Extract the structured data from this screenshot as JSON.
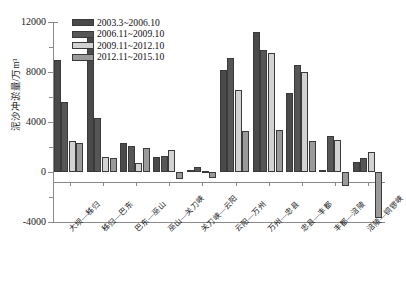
{
  "chart_data": {
    "type": "bar",
    "title": "",
    "xlabel": "",
    "ylabel": "泥沙冲淤量/万m³",
    "ylim": [
      -4000,
      12000
    ],
    "yticks": [
      -4000,
      0,
      4000,
      8000,
      12000
    ],
    "ytick_labels": [
      "-4000",
      "0",
      "4000",
      "8000",
      "12000"
    ],
    "grid": false,
    "legend_position": "top-left",
    "categories": [
      "大坝—秭归",
      "秭归—巴东",
      "巴东—巫山",
      "巫山—关刀峡",
      "关刀峡—云阳",
      "云阳—万州",
      "万州—忠县",
      "忠县—丰都",
      "丰都—涪陵",
      "涪陵—铜锣峡"
    ],
    "series": [
      {
        "name": "2003.3~2006.10",
        "color": "#4a4a4a",
        "values": [
          9000,
          11200,
          2300,
          1200,
          150,
          8200,
          11200,
          6300,
          200,
          800
        ]
      },
      {
        "name": "2006.11~2009.10",
        "color": "#565656",
        "values": [
          5600,
          4300,
          2100,
          1300,
          400,
          9100,
          9800,
          8550,
          2900,
          1100
        ]
      },
      {
        "name": "2009.11~2012.10",
        "color": "#d2d2d2",
        "values": [
          2500,
          1200,
          700,
          1800,
          100,
          6600,
          9500,
          8000,
          2600,
          1600
        ]
      },
      {
        "name": "2012.11~2015.10",
        "color": "#9a9a9a",
        "values": [
          2300,
          1150,
          1900,
          -550,
          -500,
          3300,
          3350,
          2500,
          -1100,
          -3650
        ]
      }
    ]
  }
}
